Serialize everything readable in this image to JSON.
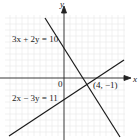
{
  "figure": {
    "type": "linear-system-graph",
    "axes": {
      "x_label": "x",
      "y_label": "y",
      "origin_label": "0"
    },
    "lines": [
      {
        "equation": "3x + 2y = 10",
        "label_position": "upper-left"
      },
      {
        "equation": "2x − 3y = 11",
        "label_position": "lower-left"
      }
    ],
    "intersection": {
      "label": "(4, −1)",
      "x": 4,
      "y": -1
    },
    "colors": {
      "grid": "#e6e6e6",
      "lines": "#1a1a1a",
      "background": "#ffffff"
    }
  }
}
